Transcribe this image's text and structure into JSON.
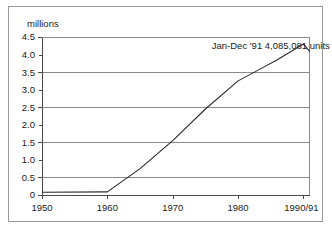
{
  "chart_data": {
    "type": "line",
    "title": "",
    "subtitle": "",
    "xlabel": "",
    "ylabel": "millions",
    "ylim": [
      0,
      4.5
    ],
    "xlim": [
      1950,
      1991
    ],
    "grid": "horizontal-major",
    "legend": "none",
    "y_ticks": [
      "4.5",
      "4.0",
      "3.5",
      "3.0",
      "2.5",
      "2.0",
      "1.5",
      "1.0",
      "0.5",
      "0"
    ],
    "y_tick_values": [
      4.5,
      4.0,
      3.5,
      3.0,
      2.5,
      2.0,
      1.5,
      1.0,
      0.5,
      0
    ],
    "y_gridline_values": [
      4.5,
      3.5,
      2.5,
      1.5,
      0.5,
      0
    ],
    "x_ticks": [
      "1950",
      "1960",
      "1970",
      "1980",
      "1990/91"
    ],
    "x_tick_values": [
      1950,
      1960,
      1970,
      1980,
      1990
    ],
    "annotations": [
      {
        "text": "Jan-Dec '91 4,085,081 units",
        "x": 1985,
        "y": 4.25
      }
    ],
    "series": [
      {
        "name": "units",
        "x": [
          1950,
          1960,
          1965,
          1970,
          1975,
          1980,
          1983,
          1986,
          1990,
          1991
        ],
        "values": [
          0.08,
          0.09,
          0.75,
          1.55,
          2.45,
          3.25,
          3.55,
          3.85,
          4.3,
          4.085
        ]
      }
    ],
    "colors": {
      "line": "#2a2a2a",
      "grid": "#8a8a8a",
      "axis": "#4a4a4a",
      "frame": "#9a9a9a",
      "text": "#1b1b1b",
      "background": "#ffffff"
    }
  }
}
